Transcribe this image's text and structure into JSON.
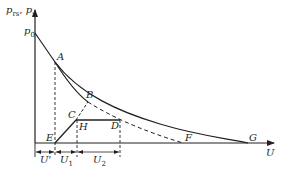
{
  "diagram": {
    "axes": {
      "y_label_main_1": "p",
      "y_label_sub_1": "rs",
      "y_label_sep": ", ",
      "y_label_main_2": "p",
      "y_label_sub_2": "s",
      "x_label": "U",
      "y_intercept_main": "p",
      "y_intercept_sub": "0"
    },
    "points": {
      "A": "A",
      "B": "B",
      "C": "C",
      "D": "D",
      "E": "E",
      "F": "F",
      "G": "G",
      "H": "H"
    },
    "dimensions": {
      "u_prime": "U'",
      "u1_main": "U",
      "u1_sub": "1",
      "u2_main": "U",
      "u2_sub": "2"
    },
    "colors": {
      "line": "#231f20",
      "background": "#ffffff"
    }
  }
}
